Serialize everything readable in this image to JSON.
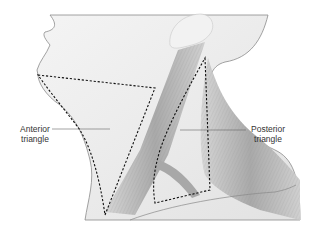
{
  "figure": {
    "labels": {
      "anterior": {
        "line1": "Anterior",
        "line2": "triangle"
      },
      "posterior": {
        "line1": "Posterior",
        "line2": "triangle"
      }
    },
    "colors": {
      "skin": "#ececec",
      "skin_shadow": "#dcdcdc",
      "muscle": "#b8b8b8",
      "muscle_dark": "#8f8f8f",
      "outline": "#777777",
      "dashed_boundary": "#111111",
      "leader_line": "#666666",
      "label_text": "#333333"
    }
  }
}
